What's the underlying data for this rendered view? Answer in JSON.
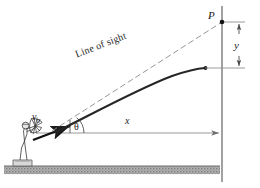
{
  "figure": {
    "labels": {
      "point_p": "P",
      "vertical_drop": "y",
      "horizontal_range": "x",
      "initial_velocity": "v",
      "initial_velocity_subscript": "0",
      "launch_angle": "θ",
      "line_of_sight": "Line of sight"
    },
    "colors": {
      "ink": "#1b1b1b",
      "trajectory": "#262626",
      "sight_line": "#8a8a8a",
      "axis": "#9a9a9a",
      "ground_fill": "#a8a8a8",
      "ground_edge": "#6e6e6e",
      "figure_outline": "#3a3a3a"
    },
    "elements": [
      "archer-figure",
      "ground-hatch",
      "velocity-arrow",
      "angle-arc",
      "trajectory-curve",
      "sight-line",
      "target-point-p",
      "vertical-reference-line",
      "y-dimension-arrow",
      "x-dimension-arrow"
    ]
  }
}
